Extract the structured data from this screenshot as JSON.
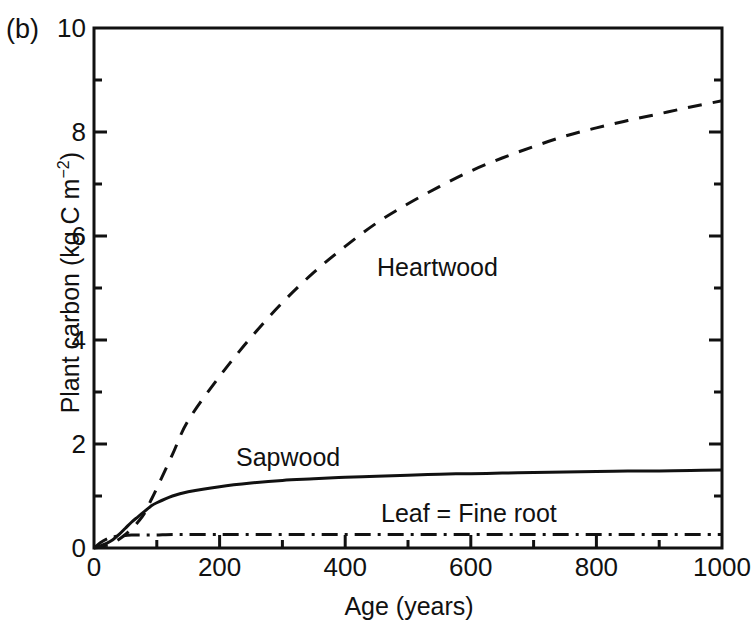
{
  "panel": {
    "label": "(b)"
  },
  "chart_data": {
    "type": "line",
    "title": "",
    "xlabel": "Age (years)",
    "ylabel": "Plant carbon (kg C m",
    "ylabel_sup": "−2",
    "ylabel_tail": ")",
    "xlim": [
      0,
      1000
    ],
    "ylim": [
      0,
      10
    ],
    "grid": false,
    "legend_position": "inline-annotations",
    "xticks": [
      0,
      200,
      400,
      600,
      800,
      1000
    ],
    "xtick_labels": [
      "0",
      "200",
      "400",
      "600",
      "800",
      "1000"
    ],
    "xminor_ticks": [
      100,
      300,
      500,
      700,
      900
    ],
    "yticks": [
      0,
      2,
      4,
      6,
      8,
      10
    ],
    "ytick_labels": [
      "0",
      "2",
      "4",
      "6",
      "8",
      "10"
    ],
    "yminor_ticks": [
      1,
      3,
      5,
      7,
      9
    ],
    "x": [
      0,
      10,
      20,
      30,
      40,
      50,
      60,
      70,
      80,
      90,
      100,
      125,
      150,
      200,
      250,
      300,
      350,
      400,
      450,
      500,
      550,
      600,
      650,
      700,
      750,
      800,
      850,
      900,
      950,
      1000
    ],
    "series": [
      {
        "name": "Heartwood",
        "style": "dashed",
        "color": "#111111",
        "values": [
          0.0,
          0.02,
          0.05,
          0.1,
          0.17,
          0.26,
          0.37,
          0.5,
          0.66,
          0.9,
          1.15,
          1.8,
          2.45,
          3.3,
          4.05,
          4.72,
          5.3,
          5.8,
          6.25,
          6.62,
          6.95,
          7.25,
          7.5,
          7.72,
          7.92,
          8.08,
          8.22,
          8.35,
          8.48,
          8.6
        ]
      },
      {
        "name": "Sapwood",
        "style": "solid",
        "color": "#111111",
        "values": [
          0.0,
          0.04,
          0.09,
          0.16,
          0.26,
          0.38,
          0.5,
          0.6,
          0.7,
          0.8,
          0.87,
          1.0,
          1.08,
          1.18,
          1.25,
          1.3,
          1.33,
          1.36,
          1.38,
          1.4,
          1.42,
          1.43,
          1.44,
          1.45,
          1.46,
          1.47,
          1.48,
          1.48,
          1.49,
          1.5
        ]
      },
      {
        "name": "Leaf = Fine root",
        "style": "dash-dot",
        "color": "#111111",
        "values": [
          0.0,
          0.1,
          0.17,
          0.21,
          0.23,
          0.24,
          0.25,
          0.25,
          0.25,
          0.25,
          0.25,
          0.26,
          0.26,
          0.26,
          0.26,
          0.26,
          0.26,
          0.26,
          0.26,
          0.26,
          0.26,
          0.26,
          0.26,
          0.26,
          0.26,
          0.26,
          0.26,
          0.26,
          0.26,
          0.26
        ]
      }
    ],
    "annotations": [
      {
        "text": "Heartwood",
        "x": 430,
        "y": 4.6
      },
      {
        "text": "Sapwood",
        "x": 200,
        "y": 2.0
      },
      {
        "text": "Leaf = Fine root",
        "x": 440,
        "y": 0.92
      }
    ]
  }
}
